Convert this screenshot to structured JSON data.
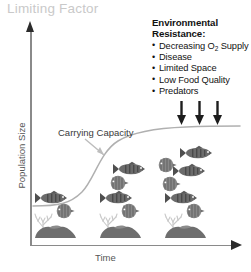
{
  "title": "Limiting Factor",
  "axes": {
    "y_label": "Population Size",
    "x_label": "Time"
  },
  "annotations": {
    "carrying_capacity": "Carrying Capacity"
  },
  "env_resistance": {
    "heading_line1": "Environmental",
    "heading_line2": "Resistance:",
    "items": [
      {
        "text": "Decreasing O",
        "sub": "2",
        "text2": " Supply"
      },
      {
        "text": "Disease",
        "sub": "",
        "text2": ""
      },
      {
        "text": "Limited Space",
        "sub": "",
        "text2": ""
      },
      {
        "text": "Low Food Quality",
        "sub": "",
        "text2": ""
      },
      {
        "text": "Predators",
        "sub": "",
        "text2": ""
      }
    ]
  },
  "colors": {
    "title": "#c9c9c9",
    "axis": "#8a8a8a",
    "arrow_head": "#2b2b2b",
    "curve": "#b0b0b0",
    "callout_arrow": "#b5b5b5",
    "text": "#121212",
    "fish_dark": "#5a5a5a",
    "fish_mid": "#8d8d8d",
    "coral": "#c4c4c4",
    "rock": "#6e6e6e"
  },
  "chart_data": {
    "type": "line",
    "title": "Limiting Factor",
    "xlabel": "Time",
    "ylabel": "Population Size",
    "grid": false,
    "legend": null,
    "series": [
      {
        "name": "Logistic population growth",
        "x": [
          0,
          10,
          20,
          30,
          40,
          50,
          60,
          70,
          80,
          90,
          100
        ],
        "y": [
          6,
          8,
          12,
          21,
          40,
          62,
          78,
          86,
          90,
          91,
          92
        ]
      }
    ],
    "annotations": [
      {
        "label": "Carrying Capacity",
        "points_to_x": 32,
        "points_to_y": 72
      },
      {
        "label": "Environmental Resistance",
        "arrows": 3,
        "direction": "down"
      }
    ],
    "xlim": [
      0,
      100
    ],
    "ylim": [
      0,
      100
    ]
  },
  "organisms": {
    "top_school": [
      {
        "type": "striped-fish",
        "x": 183,
        "y": 152,
        "w": 30,
        "flip": false
      },
      {
        "type": "disc-fish",
        "x": 159,
        "y": 163,
        "w": 16
      },
      {
        "type": "striped-fish",
        "x": 176,
        "y": 170,
        "w": 30,
        "flip": false
      },
      {
        "type": "disc-fish",
        "x": 163,
        "y": 180,
        "w": 13
      },
      {
        "type": "striped-fish",
        "x": 117,
        "y": 168,
        "w": 28,
        "flip": false
      },
      {
        "type": "disc-fish",
        "x": 112,
        "y": 181,
        "w": 14
      }
    ],
    "bottom_groups": [
      {
        "fish_x": 41,
        "fish_y": 196,
        "disc_x": 60,
        "disc_y": 209,
        "reef_x": 36,
        "reef_y": 214
      },
      {
        "fish_x": 106,
        "fish_y": 196,
        "disc_x": 125,
        "disc_y": 209,
        "reef_x": 101,
        "reef_y": 214
      },
      {
        "fish_x": 171,
        "fish_y": 196,
        "disc_x": 190,
        "disc_y": 209,
        "reef_x": 166,
        "reef_y": 214
      }
    ],
    "pressure_arrows": [
      {
        "x": 181,
        "y": 103
      },
      {
        "x": 199,
        "y": 103
      },
      {
        "x": 217,
        "y": 103
      }
    ]
  }
}
